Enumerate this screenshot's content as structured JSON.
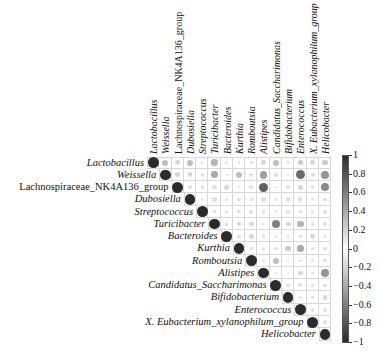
{
  "chart_data": {
    "type": "heatmap",
    "style": "corrplot-upper-circle",
    "title": "",
    "labels": [
      "Lactobacillus",
      "Weissella",
      "Lachnospiraceae_NK4A136_group",
      "Dubosiella",
      "Streptococcus",
      "Turicibacter",
      "Bacteroides",
      "Kurthia",
      "Romboutsia",
      "Alistipes",
      "Candidatus_Saccharimonas",
      "Bifidobacterium",
      "Enterococcus",
      "X. Eubacterium_xylanophilum_group",
      "Helicobacter"
    ],
    "matrix": [
      [
        1,
        0.3,
        0.2,
        0.3,
        0.05,
        0.35,
        0.1,
        0.0,
        0.05,
        0.2,
        0.3,
        0.05,
        0.25,
        0.2,
        0.25
      ],
      [
        null,
        1,
        0.2,
        0.2,
        0.1,
        0.4,
        0.0,
        0.3,
        0.15,
        0.45,
        0.1,
        0.05,
        0.7,
        0.15,
        0.5
      ],
      [
        null,
        null,
        1,
        0.1,
        0.1,
        0.15,
        0.2,
        0.05,
        0.15,
        0.75,
        0.05,
        0.1,
        0.2,
        0.1,
        0.55
      ],
      [
        null,
        null,
        null,
        1,
        0.05,
        0.15,
        0.1,
        0.1,
        0.05,
        0.15,
        0.0,
        0.15,
        0.15,
        0.1,
        0.1
      ],
      [
        null,
        null,
        null,
        null,
        1,
        0.05,
        0.1,
        0.1,
        0.15,
        0.05,
        0.0,
        0.15,
        0.05,
        0.1,
        0.15
      ],
      [
        null,
        null,
        null,
        null,
        null,
        1,
        0.1,
        0.2,
        0.2,
        0.05,
        0.6,
        0.2,
        0.35,
        0.1,
        0.1
      ],
      [
        null,
        null,
        null,
        null,
        null,
        null,
        1,
        0.1,
        0.2,
        0.05,
        0.05,
        0.05,
        0.05,
        0.2,
        0.05
      ],
      [
        null,
        null,
        null,
        null,
        null,
        null,
        null,
        1,
        0.0,
        0.1,
        0.1,
        0.25,
        0.4,
        0.05,
        0.1
      ],
      [
        null,
        null,
        null,
        null,
        null,
        null,
        null,
        null,
        1,
        0.1,
        0.3,
        0.05,
        0.05,
        0.1,
        0.1
      ],
      [
        null,
        null,
        null,
        null,
        null,
        null,
        null,
        null,
        null,
        1,
        0.05,
        0.05,
        0.2,
        0.05,
        0.5
      ],
      [
        null,
        null,
        null,
        null,
        null,
        null,
        null,
        null,
        null,
        null,
        1,
        0.1,
        0.15,
        0.1,
        0.1
      ],
      [
        null,
        null,
        null,
        null,
        null,
        null,
        null,
        null,
        null,
        null,
        null,
        1,
        0.1,
        0.05,
        0.2
      ],
      [
        null,
        null,
        null,
        null,
        null,
        null,
        null,
        null,
        null,
        null,
        null,
        null,
        1,
        0.1,
        0.15
      ],
      [
        null,
        null,
        null,
        null,
        null,
        null,
        null,
        null,
        null,
        null,
        null,
        null,
        null,
        1,
        0.15
      ],
      [
        null,
        null,
        null,
        null,
        null,
        null,
        null,
        null,
        null,
        null,
        null,
        null,
        null,
        null,
        1
      ]
    ],
    "colorbar": {
      "range": [
        -1,
        1
      ],
      "ticks": [
        "1",
        "0.8",
        "0.6",
        "0.4",
        "0.2",
        "0",
        "-0.2",
        "-0.4",
        "-0.6",
        "-0.8",
        "-1"
      ],
      "low_color": "#2b2b2b",
      "mid_color": "#ffffff",
      "high_color": "#2b2b2b"
    },
    "legend_position": "right",
    "grid": true
  }
}
